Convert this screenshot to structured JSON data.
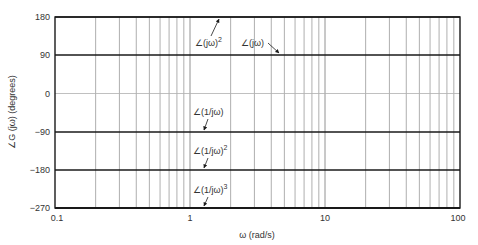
{
  "chart_data": {
    "type": "line",
    "title": "",
    "xlabel": "ω (rad/s)",
    "ylabel": "∠G (jω) (degrees)",
    "xscale": "log",
    "xlim": [
      0.1,
      100
    ],
    "ylim": [
      -270,
      180
    ],
    "x_ticks": [
      "0.1",
      "1",
      "10",
      "100"
    ],
    "y_ticks": [
      "180",
      "90",
      "0",
      "-90",
      "-180",
      "-270"
    ],
    "grid": true,
    "series": [
      {
        "name": "∠(jω)^2",
        "x": [
          0.1,
          100
        ],
        "values": [
          180,
          180
        ]
      },
      {
        "name": "∠(jω)",
        "x": [
          0.1,
          100
        ],
        "values": [
          90,
          90
        ]
      },
      {
        "name": "∠(1/jω)",
        "x": [
          0.1,
          100
        ],
        "values": [
          -90,
          -90
        ]
      },
      {
        "name": "∠(1/jω)^2",
        "x": [
          0.1,
          100
        ],
        "values": [
          -180,
          -180
        ]
      },
      {
        "name": "∠(1/jω)^3",
        "x": [
          0.1,
          100
        ],
        "values": [
          -270,
          -270
        ]
      }
    ],
    "annotations": [
      {
        "text": "∠(jω)",
        "sup": "2",
        "target_x": 1.35,
        "target_y": 180
      },
      {
        "text": "∠(jω)",
        "sup": "",
        "target_x": 3.0,
        "target_y": 90
      },
      {
        "text": "∠(1/jω)",
        "sup": "",
        "target_x": 1.3,
        "target_y": -90
      },
      {
        "text": "∠(1/jω)",
        "sup": "2",
        "target_x": 1.3,
        "target_y": -180
      },
      {
        "text": "∠(1/jω)",
        "sup": "3",
        "target_x": 1.3,
        "target_y": -270
      }
    ]
  },
  "labels": {
    "xlabel": "ω (rad/s)",
    "ylabel": "∠G (jω) (degrees)",
    "x_ticks": [
      "0.1",
      "1",
      "10",
      "100"
    ],
    "y_ticks": [
      "180",
      "90",
      "0",
      "−90",
      "−180",
      "−270"
    ],
    "ann_jw2": "∠(jω)",
    "ann_jw2_sup": "2",
    "ann_jw": "∠(jω)",
    "ann_inv": "∠(1/jω)",
    "ann_inv2": "∠(1/jω)",
    "ann_inv2_sup": "2",
    "ann_inv3": "∠(1/jω)",
    "ann_inv3_sup": "3"
  },
  "colors": {
    "grid_minor": "#9a9a9a",
    "grid_zero": "#b0b0b0",
    "series_line": "#1a1a1a",
    "frame": "#1a1a1a"
  }
}
